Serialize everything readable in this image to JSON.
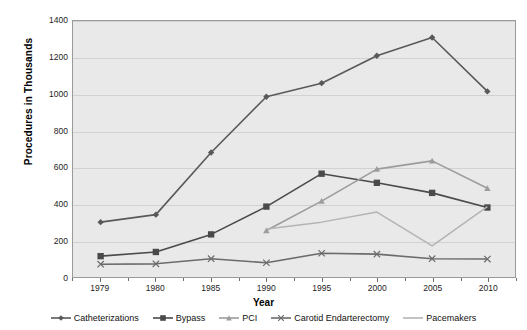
{
  "chart_data": {
    "type": "line",
    "title": "",
    "xlabel": "Year",
    "ylabel": "Procedures in Thousands",
    "categories": [
      "1979",
      "1980",
      "1985",
      "1990",
      "1995",
      "2000",
      "2005",
      "2010"
    ],
    "ylim": [
      0,
      1400
    ],
    "ytick_step": 200,
    "yticks": [
      "1400",
      "1200",
      "1000",
      "800",
      "600",
      "400",
      "200",
      "0"
    ],
    "grid": "horizontal",
    "legend_position": "bottom",
    "series": [
      {
        "name": "Catheterizations",
        "marker": "diamond",
        "color": "#595959",
        "values": [
          300,
          341,
          681,
          986,
          1060,
          1210,
          1310,
          1015
        ]
      },
      {
        "name": "Bypass",
        "marker": "square",
        "color": "#4a4a4a",
        "values": [
          114,
          137,
          233,
          385,
          565,
          515,
          460,
          380
        ]
      },
      {
        "name": "PCI",
        "marker": "triangle",
        "color": "#9c9c9c",
        "values": [
          null,
          null,
          null,
          254,
          415,
          590,
          635,
          485
        ]
      },
      {
        "name": "Carotid Endarterectomy",
        "marker": "x",
        "color": "#6b6b6b",
        "values": [
          70,
          72,
          100,
          78,
          130,
          125,
          100,
          98
        ]
      },
      {
        "name": "Pacemakers",
        "marker": "none",
        "color": "#b4b4b4",
        "values": [
          null,
          null,
          null,
          262,
          300,
          355,
          170,
          385
        ]
      }
    ]
  },
  "style": {
    "plot_background": "#e9e9e9",
    "grid_color": "#d2d2d2",
    "axis_color": "#9a9a9a",
    "page_background": "#ffffff"
  }
}
